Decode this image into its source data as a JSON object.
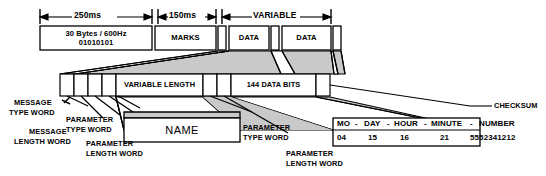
{
  "diagram": {
    "colors": {
      "stroke": "#000000",
      "fill_white": "#ffffff",
      "fill_shade": "#c9c9c9",
      "background": "#ffffff"
    },
    "dimensions": [
      {
        "id": "dim-250ms",
        "label": "250ms"
      },
      {
        "id": "dim-150ms",
        "label": "150ms"
      },
      {
        "id": "dim-variable",
        "label": "VARIABLE"
      }
    ],
    "frame_row": {
      "preamble": {
        "line1": "30 Bytes / 600Hz",
        "line2": "01010101"
      },
      "blocks": [
        {
          "id": "marks",
          "label": "MARKS"
        },
        {
          "id": "gap-1",
          "label": ""
        },
        {
          "id": "data-1",
          "label": "DATA"
        },
        {
          "id": "gap-2",
          "label": ""
        },
        {
          "id": "data-2",
          "label": "DATA"
        },
        {
          "id": "gap-3",
          "label": ""
        }
      ]
    },
    "expanded_row": {
      "small_cells_left": [
        "",
        "",
        "",
        ""
      ],
      "variable_length_label": "VARIABLE LENGTH",
      "small_cells_mid": [
        "",
        ""
      ],
      "data_bits_label": "144 DATA BITS",
      "checksum_cell": ""
    },
    "detail_name_box": {
      "label": "NAME"
    },
    "detail_table": {
      "headers": [
        "MO",
        "-",
        "DAY",
        "-",
        "HOUR",
        "-",
        "MINUTE",
        "-",
        "NUMBER"
      ],
      "header_line": "MO  -  DAY - HOUR - MINUTE  -  NUMBER",
      "values": [
        "04",
        "15",
        "16",
        "21",
        "5552341212"
      ]
    },
    "callouts": [
      {
        "id": "message-type-word",
        "line1": "MESSAGE",
        "line2": "TYPE WORD"
      },
      {
        "id": "message-length-word",
        "line1": "MESSAGE",
        "line2": "LENGTH WORD"
      },
      {
        "id": "parameter-type-word-1",
        "line1": "PARAMETER",
        "line2": "TYPE WORD"
      },
      {
        "id": "parameter-length-word-1",
        "line1": "PARAMETER",
        "line2": "LENGTH WORD"
      },
      {
        "id": "parameter-type-word-2",
        "line1": "PARAMETER",
        "line2": "TYPE WORD"
      },
      {
        "id": "parameter-length-word-2",
        "line1": "PARAMETER",
        "line2": "LENGTH WORD"
      },
      {
        "id": "checksum",
        "line1": "CHECKSUM",
        "line2": ""
      }
    ]
  }
}
